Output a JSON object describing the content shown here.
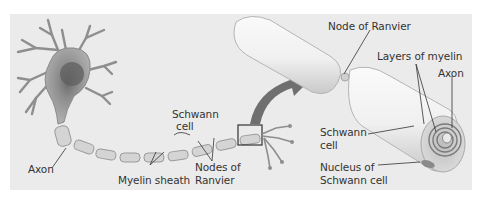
{
  "figure": {
    "colors": {
      "background": "#ffffff",
      "panel": "#ebebeb",
      "label_text": "#333333",
      "leader_line": "#333333",
      "neuron": "#a8a8a8",
      "sheath": "#d6d6d6",
      "arrow": "#6f6f6f"
    },
    "left_view": {
      "labels": {
        "axon": "Axon",
        "myelin_sheath": "Myelin sheath",
        "schwann_cell_line1": "Schwann",
        "schwann_cell_line2": "cell",
        "nodes_line1": "Nodes of",
        "nodes_line2": "Ranvier"
      }
    },
    "right_view": {
      "labels": {
        "node_of_ranvier": "Node of Ranvier",
        "layers_of_myelin": "Layers of myelin",
        "axon": "Axon",
        "schwann_cell_line1": "Schwann",
        "schwann_cell_line2": "cell",
        "nucleus_line1": "Nucleus of",
        "nucleus_line2": "Schwann cell"
      }
    }
  }
}
